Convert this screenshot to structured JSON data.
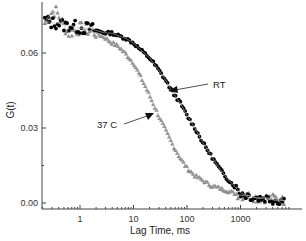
{
  "chart_data": {
    "type": "scatter",
    "title": "",
    "xlabel": "Lag Time, ms",
    "ylabel": "G(t)",
    "xscale": "log",
    "xlim": [
      0.2,
      8000
    ],
    "ylim": [
      -0.0024,
      0.08
    ],
    "x_ticks": [
      1,
      10,
      100,
      1000
    ],
    "x_tick_labels": [
      "1",
      "10",
      "100",
      "1000"
    ],
    "y_ticks": [
      0.0,
      0.03,
      0.06
    ],
    "y_tick_labels": [
      "0.00",
      "0.03",
      "0.06"
    ],
    "y_minor_ticks": [
      0.015,
      0.045
    ],
    "grid": false,
    "legend": null,
    "annotations": [
      {
        "text": "RT",
        "arrow_to": {
          "x": 62,
          "y": 0.045
        }
      },
      {
        "text": "37 C",
        "arrow_to": {
          "x": 19,
          "y": 0.035
        }
      }
    ],
    "series": [
      {
        "name": "RT",
        "marker": "circle",
        "color": "#000000",
        "x": [
          0.22,
          0.3,
          0.4,
          0.5,
          0.7,
          1,
          1.5,
          2,
          3,
          4,
          5,
          7,
          10,
          14,
          20,
          28,
          40,
          55,
          75,
          100,
          140,
          200,
          280,
          400,
          550,
          750,
          1000,
          1400,
          2000,
          3000,
          4500,
          6500
        ],
        "y": [
          0.073,
          0.072,
          0.072,
          0.071,
          0.071,
          0.07,
          0.07,
          0.069,
          0.068,
          0.068,
          0.067,
          0.066,
          0.064,
          0.061,
          0.058,
          0.054,
          0.049,
          0.044,
          0.04,
          0.035,
          0.03,
          0.024,
          0.019,
          0.014,
          0.01,
          0.007,
          0.004,
          0.003,
          0.002,
          0.002,
          0.001,
          0.001
        ]
      },
      {
        "name": "37 C",
        "marker": "triangle",
        "color": "#8c8c8c",
        "x": [
          0.22,
          0.28,
          0.35,
          0.45,
          0.6,
          0.8,
          1,
          1.5,
          2,
          3,
          4,
          5,
          7,
          10,
          14,
          20,
          28,
          40,
          55,
          75,
          100,
          140,
          200,
          280,
          400,
          550,
          750,
          1000,
          1400,
          2000,
          3000,
          4500,
          6500
        ],
        "y": [
          0.072,
          0.076,
          0.077,
          0.073,
          0.068,
          0.069,
          0.07,
          0.069,
          0.068,
          0.066,
          0.064,
          0.063,
          0.06,
          0.056,
          0.05,
          0.043,
          0.036,
          0.029,
          0.023,
          0.018,
          0.014,
          0.011,
          0.009,
          0.007,
          0.006,
          0.005,
          0.004,
          0.003,
          0.003,
          0.002,
          0.002,
          0.002,
          0.001
        ]
      }
    ]
  }
}
